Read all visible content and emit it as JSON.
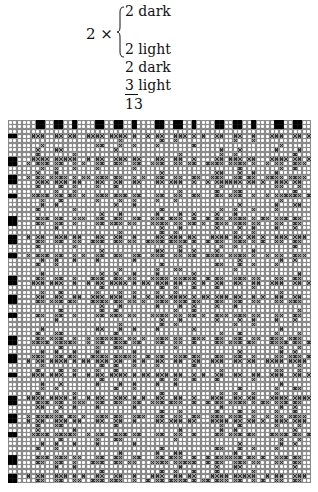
{
  "formula": {
    "multiplier": "2 ×",
    "lines": [
      "2 dark",
      "2 light",
      "2 dark",
      "3 light",
      "13"
    ],
    "repeat_total": 13
  },
  "draft": {
    "cols": 66,
    "rows": 79,
    "color_sequence": [
      "light",
      "light",
      "light",
      "light",
      "dark",
      "dark",
      "light",
      "light",
      "dark",
      "dark",
      "light",
      "light",
      "dark"
    ],
    "threading_top_rows": 2,
    "tieup_left_cols": 2,
    "colors": {
      "dark": "#000000",
      "open_fill": "#ffffff",
      "grid_line": "#8a8a8a",
      "cross": "#333333"
    }
  }
}
